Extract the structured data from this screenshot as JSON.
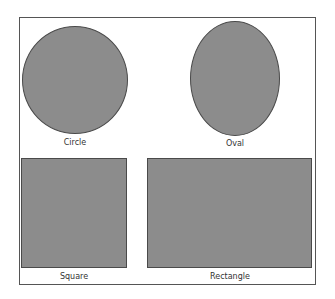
{
  "shapes": [
    {
      "name": "circle",
      "label": "Circle"
    },
    {
      "name": "oval",
      "label": "Oval"
    },
    {
      "name": "square",
      "label": "Square"
    },
    {
      "name": "rectangle",
      "label": "Rectangle"
    }
  ],
  "colors": {
    "fill": "#8c8c8c",
    "stroke": "#4a4a4a",
    "frame": "#555555"
  }
}
